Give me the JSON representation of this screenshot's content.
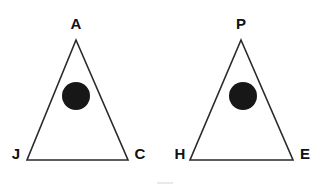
{
  "figure": {
    "background_color": "#ffffff",
    "stroke_color": "#2a2a2a",
    "label_color": "#111111",
    "dot_color": "#171717",
    "artifact_color": "#e9e9e9",
    "shapes": [
      {
        "name": "left-triangle",
        "type": "triangle",
        "apex": {
          "x": 76,
          "y": 40
        },
        "base_left": {
          "x": 27,
          "y": 160
        },
        "base_right": {
          "x": 128,
          "y": 160
        },
        "labels": {
          "apex": "A",
          "base_left": "J",
          "base_right": "C"
        },
        "label_positions": {
          "apex": {
            "x": 76,
            "y": 25
          },
          "base_left": {
            "x": 16,
            "y": 155
          },
          "base_right": {
            "x": 140,
            "y": 155
          }
        },
        "inner_circle": {
          "cx": 76,
          "cy": 96,
          "r": 14
        }
      },
      {
        "name": "right-triangle",
        "type": "triangle",
        "apex": {
          "x": 241,
          "y": 40
        },
        "base_left": {
          "x": 190,
          "y": 160
        },
        "base_right": {
          "x": 293,
          "y": 160
        },
        "labels": {
          "apex": "P",
          "base_left": "H",
          "base_right": "E"
        },
        "label_positions": {
          "apex": {
            "x": 241,
            "y": 25
          },
          "base_left": {
            "x": 180,
            "y": 155
          },
          "base_right": {
            "x": 305,
            "y": 155
          }
        },
        "inner_circle": {
          "cx": 243,
          "cy": 96,
          "r": 14
        }
      }
    ],
    "artifact": {
      "x": 157,
      "y": 182,
      "width": 16,
      "height": 2
    }
  }
}
